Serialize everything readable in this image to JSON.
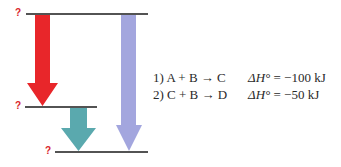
{
  "colors": {
    "level_line": "#1a1a1a",
    "question_mark": "#d9252a",
    "arrow_reaction_1": "#e8262a",
    "arrow_reaction_2": "#5aa9ae",
    "arrow_overall": "#a3a6de",
    "text": "#2a2a2a"
  },
  "levels": [
    {
      "id": "top",
      "label": "?"
    },
    {
      "id": "middle",
      "label": "?"
    },
    {
      "id": "bottom",
      "label": "?"
    }
  ],
  "reactions": [
    {
      "number": "1)",
      "equation": "A + B → C",
      "dh_symbol": "ΔH°",
      "dh_value": "= −100 kJ"
    },
    {
      "number": "2)",
      "equation": "C + B → D",
      "dh_symbol": "ΔH°",
      "dh_value": "= −50 kJ"
    }
  ]
}
